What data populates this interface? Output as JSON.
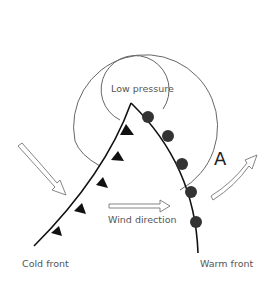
{
  "diagram": {
    "labels": {
      "low_pressure": "Low pressure",
      "wind_direction": "Wind direction",
      "cold_front": "Cold front",
      "warm_front": "Warm front",
      "point_a": "A"
    },
    "colors": {
      "isobar": "#666666",
      "front_line": "#111111",
      "arrow_outline": "#777777",
      "text": "#555555"
    }
  }
}
